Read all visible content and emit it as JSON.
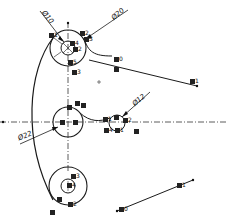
{
  "diagram": {
    "type": "cad-geometric-construction",
    "background": "#ffffff",
    "line_color": "#1a1a1a",
    "centerlines": {
      "horizontal": {
        "y": 122,
        "x1": 0,
        "x2": 228
      },
      "vertical": {
        "x": 68,
        "y1": 22,
        "y2": 172
      }
    },
    "circles": [
      {
        "id": "top-outer",
        "cx": 68,
        "cy": 48,
        "r": 18
      },
      {
        "id": "top-inner",
        "cx": 68,
        "cy": 48,
        "r": 7
      },
      {
        "id": "mid-outer",
        "cx": 68,
        "cy": 122,
        "r": 15
      },
      {
        "id": "small-right",
        "cx": 117,
        "cy": 123,
        "r": 8
      },
      {
        "id": "bottom-outer",
        "cx": 68,
        "cy": 186,
        "r": 19
      },
      {
        "id": "bottom-inner",
        "cx": 68,
        "cy": 186,
        "r": 7
      }
    ],
    "dimensions": [
      {
        "id": "dim-top-inner",
        "text": "Ø10",
        "x": 42,
        "y": 12,
        "rotate": 52
      },
      {
        "id": "dim-top-outer",
        "text": "Ø20",
        "x": 112,
        "y": 12,
        "rotate": -40
      },
      {
        "id": "dim-small-right",
        "text": "Ø12",
        "x": 133,
        "y": 98,
        "rotate": -40
      },
      {
        "id": "dim-mid",
        "text": "Ø22",
        "x": 20,
        "y": 132,
        "rotate": -22
      }
    ],
    "markers": [
      {
        "text": "1",
        "x": 49,
        "y": 34
      },
      {
        "text": "2",
        "x": 80,
        "y": 32
      },
      {
        "text": "3",
        "x": 84,
        "y": 37
      },
      {
        "text": "4",
        "x": 69,
        "y": 41
      },
      {
        "text": "2",
        "x": 74,
        "y": 46
      },
      {
        "text": "5",
        "x": 69,
        "y": 60
      },
      {
        "text": "3",
        "x": 73,
        "y": 71
      },
      {
        "text": "0",
        "x": 87,
        "y": 57
      },
      {
        "text": "",
        "x": 89,
        "y": 66
      },
      {
        "text": "1",
        "x": 190,
        "y": 79
      },
      {
        "text": "",
        "x": 68,
        "y": 105
      },
      {
        "text": "",
        "x": 77,
        "y": 101
      },
      {
        "text": "",
        "x": 82,
        "y": 103
      },
      {
        "text": "",
        "x": 60,
        "y": 119
      },
      {
        "text": "",
        "x": 74,
        "y": 119
      },
      {
        "text": "1",
        "x": 104,
        "y": 117
      },
      {
        "text": "2",
        "x": 124,
        "y": 118
      },
      {
        "text": "",
        "x": 115,
        "y": 115
      },
      {
        "text": "4",
        "x": 105,
        "y": 127
      },
      {
        "text": "1",
        "x": 116,
        "y": 127
      },
      {
        "text": "",
        "x": 134,
        "y": 128
      },
      {
        "text": "3",
        "x": 71,
        "y": 174
      },
      {
        "text": "4",
        "x": 68,
        "y": 183
      },
      {
        "text": "",
        "x": 57,
        "y": 198
      },
      {
        "text": "2",
        "x": 70,
        "y": 202
      },
      {
        "text": "",
        "x": 50,
        "y": 210
      },
      {
        "text": "0",
        "x": 119,
        "y": 208
      },
      {
        "text": "1",
        "x": 177,
        "y": 184
      }
    ],
    "center_cross": {
      "x": 99,
      "y": 82
    }
  }
}
